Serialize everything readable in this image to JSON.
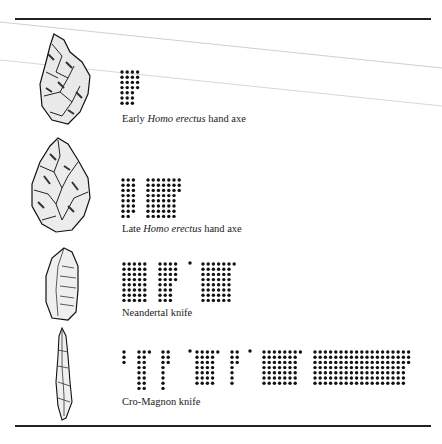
{
  "figure": {
    "rows": [
      {
        "id": "early-homo-erectus",
        "caption_prefix": "Early ",
        "caption_italic": "Homo erectus",
        "caption_suffix": " hand axe",
        "artifact": "hand-axe-early",
        "dot_groups": [
          {
            "rows": [
              4,
              4,
              4,
              4,
              3,
              3,
              3
            ]
          }
        ]
      },
      {
        "id": "late-homo-erectus",
        "caption_prefix": "Late ",
        "caption_italic": "Homo erectus",
        "caption_suffix": " hand axe",
        "artifact": "hand-axe-late",
        "dot_groups": [
          {
            "rows": [
              3,
              3,
              3,
              3,
              3,
              3,
              3,
              2
            ]
          },
          {
            "rows": [
              7,
              7,
              7,
              6,
              6,
              6,
              6,
              6
            ]
          }
        ]
      },
      {
        "id": "neandertal",
        "caption_prefix": "Neandertal knife",
        "caption_italic": "",
        "caption_suffix": "",
        "artifact": "knife-neandertal",
        "dot_groups": [
          {
            "rows": [
              5,
              5,
              5,
              5,
              5,
              5,
              5,
              5
            ]
          },
          {
            "rows": [
              4,
              4,
              4,
              4,
              3,
              3,
              3,
              3
            ]
          },
          {
            "rows": [
              1
            ]
          },
          {
            "rows": [
              7,
              6,
              6,
              6,
              6,
              6,
              6,
              6
            ]
          }
        ]
      },
      {
        "id": "cro-magnon",
        "caption_prefix": "Cro-Magnon knife",
        "caption_italic": "",
        "caption_suffix": "",
        "artifact": "knife-cro-magnon",
        "dot_groups": [
          {
            "rows": [
              1,
              1,
              1
            ]
          },
          {
            "rows": [
              3,
              2,
              2,
              2,
              2,
              2,
              2,
              2
            ]
          },
          {
            "rows": [
              2,
              2,
              2,
              1,
              1,
              1,
              1,
              1
            ]
          },
          {
            "rows": [
              1
            ]
          },
          {
            "rows": [
              5,
              4,
              4,
              4,
              4,
              4,
              4
            ]
          },
          {
            "rows": [
              2,
              2,
              2,
              1,
              1,
              1,
              1
            ]
          },
          {
            "rows": [
              1
            ]
          },
          {
            "rows": [
              8,
              7,
              7,
              7,
              7,
              7,
              7
            ]
          },
          {
            "rows": [
              19,
              19,
              19,
              18,
              18,
              18,
              18
            ]
          }
        ]
      }
    ]
  }
}
